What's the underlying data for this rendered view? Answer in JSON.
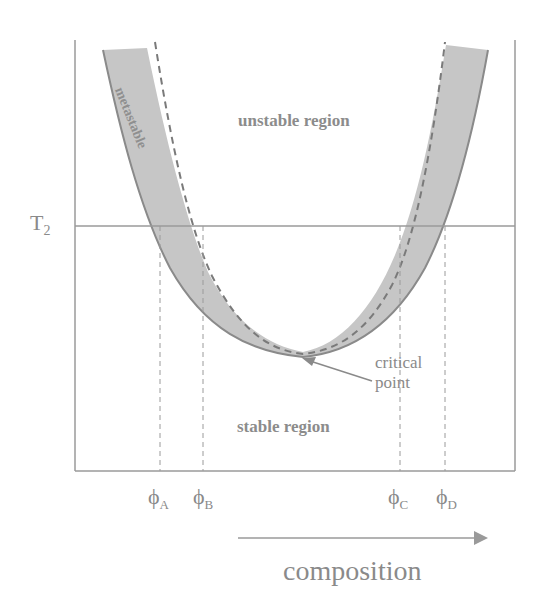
{
  "diagram": {
    "temperature_label": {
      "main": "T",
      "sub": "2"
    },
    "regions": {
      "unstable": "unstable region",
      "stable": "stable region",
      "metastable": "metastable"
    },
    "critical_point": {
      "line1": "critical",
      "line2": "point"
    },
    "compositions": [
      {
        "main": "ϕ",
        "sub": "A"
      },
      {
        "main": "ϕ",
        "sub": "B"
      },
      {
        "main": "ϕ",
        "sub": "C"
      },
      {
        "main": "ϕ",
        "sub": "D"
      }
    ],
    "x_axis_label": "composition",
    "colors": {
      "axis": "#9a9a9a",
      "band_fill": "#c4c4c4",
      "curve": "#8a8a8a",
      "text": "#8a8a8a"
    }
  }
}
